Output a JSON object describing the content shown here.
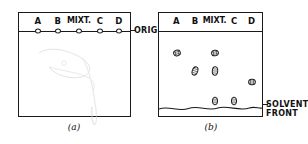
{
  "figure": {
    "ink_color": "#1a1a1a",
    "paper_color": "#ffffff"
  },
  "lanes": [
    {
      "id": "lane-a",
      "label": "A",
      "x_pct": 17
    },
    {
      "id": "lane-b",
      "label": "B",
      "x_pct": 35
    },
    {
      "id": "lane-mixt",
      "label": "MIXT.",
      "x_pct": 54
    },
    {
      "id": "lane-c",
      "label": "C",
      "x_pct": 73
    },
    {
      "id": "lane-d",
      "label": "D",
      "x_pct": 90
    }
  ],
  "panel_a": {
    "caption": "(a)",
    "origin_label": "ORIGIN",
    "origin_line_y_pct": 17,
    "spots": [
      {
        "lane": "A",
        "x_pct": 17,
        "y_pct": 17
      },
      {
        "lane": "B",
        "x_pct": 35,
        "y_pct": 17
      },
      {
        "lane": "MIXT.",
        "x_pct": 54,
        "y_pct": 17
      },
      {
        "lane": "C",
        "x_pct": 73,
        "y_pct": 17
      },
      {
        "lane": "D",
        "x_pct": 90,
        "y_pct": 17
      }
    ]
  },
  "panel_b": {
    "caption": "(b)",
    "solvent_front_label": "SOLVENT\nFRONT",
    "origin_line_y_pct": 17,
    "solvent_front_y_pct": 93,
    "spots": [
      {
        "lane": "A",
        "x_pct": 17,
        "y_pct": 39,
        "w": 7,
        "h": 6,
        "rot": -15
      },
      {
        "lane": "B",
        "x_pct": 35,
        "y_pct": 56,
        "w": 6,
        "h": 9,
        "rot": 20
      },
      {
        "lane": "MIXT.",
        "x_pct": 54,
        "y_pct": 39,
        "w": 7,
        "h": 6,
        "rot": -10
      },
      {
        "lane": "MIXT.",
        "x_pct": 54,
        "y_pct": 56,
        "w": 6,
        "h": 9,
        "rot": 5
      },
      {
        "lane": "MIXT.",
        "x_pct": 54,
        "y_pct": 85,
        "w": 6,
        "h": 8,
        "rot": 0
      },
      {
        "lane": "C",
        "x_pct": 73,
        "y_pct": 85,
        "w": 6,
        "h": 8,
        "rot": 0
      },
      {
        "lane": "D",
        "x_pct": 90,
        "y_pct": 67,
        "w": 7,
        "h": 6,
        "rot": 5
      }
    ]
  }
}
